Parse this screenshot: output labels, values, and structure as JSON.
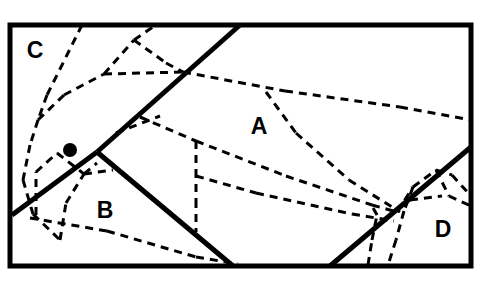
{
  "figure": {
    "type": "partition-diagram",
    "title": "",
    "canvas": {
      "width": 486,
      "height": 285,
      "background": "#ffffff"
    },
    "styles": {
      "solid_color": "#000000",
      "solid_width": 5,
      "border_width": 5,
      "dashed_color": "#000000",
      "dashed_width": 3,
      "dash_pattern": "8 6",
      "label_color": "#000000",
      "marker_color": "#000000"
    },
    "boundary": {
      "name": "outer-rectangle",
      "x1": 10,
      "y1": 25,
      "x2": 471,
      "y2": 266
    },
    "solid_edges": [
      {
        "name": "edge-c-a",
        "x1": 240,
        "y1": 25,
        "x2": 97,
        "y2": 152
      },
      {
        "name": "edge-c-b",
        "x1": 97,
        "y1": 152,
        "x2": 12,
        "y2": 215
      },
      {
        "name": "edge-b-a",
        "x1": 97,
        "y1": 152,
        "x2": 233,
        "y2": 266
      },
      {
        "name": "edge-a-d",
        "x1": 330,
        "y1": 266,
        "x2": 471,
        "y2": 147
      }
    ],
    "dashed_edges": [
      {
        "name": "dashed-1",
        "x1": 82,
        "y1": 25,
        "x2": 47,
        "y2": 95
      },
      {
        "name": "dashed-2",
        "x1": 47,
        "y1": 95,
        "x2": 38,
        "y2": 120
      },
      {
        "name": "dashed-3",
        "x1": 38,
        "y1": 120,
        "x2": 64,
        "y2": 95
      },
      {
        "name": "dashed-4",
        "x1": 64,
        "y1": 95,
        "x2": 104,
        "y2": 74
      },
      {
        "name": "dashed-5",
        "x1": 104,
        "y1": 74,
        "x2": 183,
        "y2": 72
      },
      {
        "name": "dashed-6",
        "x1": 183,
        "y1": 72,
        "x2": 285,
        "y2": 91
      },
      {
        "name": "dashed-7",
        "x1": 285,
        "y1": 91,
        "x2": 400,
        "y2": 107
      },
      {
        "name": "dashed-8",
        "x1": 400,
        "y1": 107,
        "x2": 471,
        "y2": 120
      },
      {
        "name": "dashed-9",
        "x1": 104,
        "y1": 74,
        "x2": 134,
        "y2": 40
      },
      {
        "name": "dashed-10",
        "x1": 134,
        "y1": 40,
        "x2": 156,
        "y2": 25
      },
      {
        "name": "dashed-11",
        "x1": 134,
        "y1": 40,
        "x2": 166,
        "y2": 63
      },
      {
        "name": "dashed-12",
        "x1": 166,
        "y1": 63,
        "x2": 183,
        "y2": 72
      },
      {
        "name": "dashed-13",
        "x1": 30,
        "y1": 145,
        "x2": 23,
        "y2": 180
      },
      {
        "name": "dashed-14",
        "x1": 23,
        "y1": 180,
        "x2": 33,
        "y2": 214
      },
      {
        "name": "dashed-15",
        "x1": 33,
        "y1": 214,
        "x2": 60,
        "y2": 240
      },
      {
        "name": "dashed-16",
        "x1": 38,
        "y1": 120,
        "x2": 30,
        "y2": 145
      },
      {
        "name": "dashed-17",
        "x1": 30,
        "y1": 218,
        "x2": 107,
        "y2": 231
      },
      {
        "name": "dashed-18",
        "x1": 107,
        "y1": 231,
        "x2": 196,
        "y2": 257
      },
      {
        "name": "dashed-19",
        "x1": 196,
        "y1": 257,
        "x2": 238,
        "y2": 264
      },
      {
        "name": "dashed-20",
        "x1": 36,
        "y1": 215,
        "x2": 36,
        "y2": 172
      },
      {
        "name": "dashed-21",
        "x1": 36,
        "y1": 172,
        "x2": 57,
        "y2": 153
      },
      {
        "name": "dashed-22",
        "x1": 60,
        "y1": 240,
        "x2": 66,
        "y2": 203
      },
      {
        "name": "dashed-23",
        "x1": 66,
        "y1": 203,
        "x2": 84,
        "y2": 174
      },
      {
        "name": "dashed-24",
        "x1": 84,
        "y1": 174,
        "x2": 97,
        "y2": 163
      },
      {
        "name": "dashed-25",
        "x1": 84,
        "y1": 174,
        "x2": 113,
        "y2": 170
      },
      {
        "name": "dashed-26",
        "x1": 140,
        "y1": 117,
        "x2": 196,
        "y2": 141
      },
      {
        "name": "dashed-27",
        "x1": 196,
        "y1": 141,
        "x2": 286,
        "y2": 176
      },
      {
        "name": "dashed-28",
        "x1": 286,
        "y1": 176,
        "x2": 372,
        "y2": 205
      },
      {
        "name": "dashed-29",
        "x1": 372,
        "y1": 205,
        "x2": 397,
        "y2": 212
      },
      {
        "name": "dashed-30",
        "x1": 196,
        "y1": 141,
        "x2": 196,
        "y2": 170
      },
      {
        "name": "dashed-31",
        "x1": 196,
        "y1": 170,
        "x2": 196,
        "y2": 200
      },
      {
        "name": "dashed-32",
        "x1": 196,
        "y1": 200,
        "x2": 196,
        "y2": 232
      },
      {
        "name": "dashed-33",
        "x1": 196,
        "y1": 176,
        "x2": 256,
        "y2": 193
      },
      {
        "name": "dashed-34",
        "x1": 256,
        "y1": 193,
        "x2": 352,
        "y2": 214
      },
      {
        "name": "dashed-35",
        "x1": 352,
        "y1": 214,
        "x2": 394,
        "y2": 221
      },
      {
        "name": "dashed-36",
        "x1": 266,
        "y1": 92,
        "x2": 296,
        "y2": 133
      },
      {
        "name": "dashed-37",
        "x1": 296,
        "y1": 133,
        "x2": 349,
        "y2": 180
      },
      {
        "name": "dashed-38",
        "x1": 349,
        "y1": 180,
        "x2": 400,
        "y2": 212
      },
      {
        "name": "dashed-39",
        "x1": 116,
        "y1": 133,
        "x2": 160,
        "y2": 116
      },
      {
        "name": "dashed-40",
        "x1": 397,
        "y1": 212,
        "x2": 413,
        "y2": 187
      },
      {
        "name": "dashed-41",
        "x1": 413,
        "y1": 187,
        "x2": 436,
        "y2": 170
      },
      {
        "name": "dashed-42",
        "x1": 436,
        "y1": 170,
        "x2": 452,
        "y2": 175
      },
      {
        "name": "dashed-43",
        "x1": 452,
        "y1": 175,
        "x2": 471,
        "y2": 196
      },
      {
        "name": "dashed-44",
        "x1": 413,
        "y1": 187,
        "x2": 404,
        "y2": 211
      },
      {
        "name": "dashed-45",
        "x1": 404,
        "y1": 211,
        "x2": 396,
        "y2": 240
      },
      {
        "name": "dashed-46",
        "x1": 396,
        "y1": 240,
        "x2": 388,
        "y2": 265
      },
      {
        "name": "dashed-47",
        "x1": 368,
        "y1": 265,
        "x2": 372,
        "y2": 240
      },
      {
        "name": "dashed-48",
        "x1": 372,
        "y1": 240,
        "x2": 377,
        "y2": 215
      },
      {
        "name": "dashed-49",
        "x1": 377,
        "y1": 215,
        "x2": 372,
        "y2": 206
      },
      {
        "name": "dashed-50",
        "x1": 436,
        "y1": 170,
        "x2": 449,
        "y2": 196
      },
      {
        "name": "dashed-51",
        "x1": 449,
        "y1": 196,
        "x2": 471,
        "y2": 206
      },
      {
        "name": "dashed-52",
        "x1": 410,
        "y1": 200,
        "x2": 442,
        "y2": 196
      },
      {
        "name": "dashed-53",
        "x1": 57,
        "y1": 153,
        "x2": 84,
        "y2": 174
      }
    ],
    "marker": {
      "name": "point-marker",
      "cx": 70,
      "cy": 150,
      "r": 7
    },
    "labels": [
      {
        "name": "region-label-c",
        "text": "C",
        "x": 35,
        "y": 52
      },
      {
        "name": "region-label-a",
        "text": "A",
        "x": 259,
        "y": 128
      },
      {
        "name": "region-label-b",
        "text": "B",
        "x": 105,
        "y": 212
      },
      {
        "name": "region-label-d",
        "text": "D",
        "x": 443,
        "y": 231
      }
    ]
  }
}
